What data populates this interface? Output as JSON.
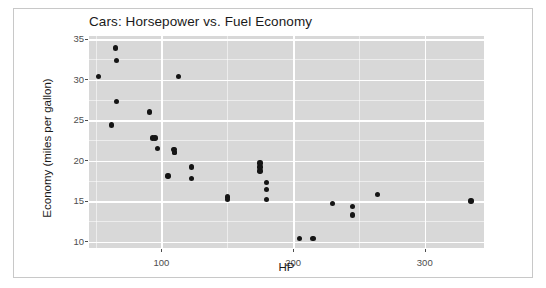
{
  "chart_data": {
    "type": "scatter",
    "title": "Cars: Horsepower vs. Fuel Economy",
    "xlabel": "HP",
    "ylabel": "Economy (miles per gallon)",
    "xlim": [
      45,
      345
    ],
    "ylim": [
      9.2,
      35.4
    ],
    "grid": true,
    "legend": null,
    "x_ticks": [
      100,
      200,
      300
    ],
    "x_tick_labels": [
      "100",
      "200",
      "300"
    ],
    "x_minor_ticks": [
      50,
      150,
      250,
      350
    ],
    "y_ticks": [
      10,
      15,
      20,
      25,
      30,
      35
    ],
    "y_tick_labels": [
      "10",
      "15",
      "20",
      "25",
      "30",
      "35"
    ],
    "y_minor_ticks": [
      12.5,
      17.5,
      22.5,
      27.5,
      32.5
    ],
    "point_color": "#151515",
    "panel_background": "#d8d8d8",
    "gridline_color": "#ffffff",
    "series": [
      {
        "name": "cars",
        "x": [
          110,
          110,
          93,
          110,
          175,
          105,
          245,
          62,
          95,
          123,
          123,
          180,
          180,
          180,
          205,
          215,
          230,
          66,
          52,
          65,
          97,
          150,
          150,
          245,
          175,
          66,
          91,
          113,
          264,
          175,
          335,
          109
        ],
        "y": [
          21.0,
          21.0,
          22.8,
          21.4,
          18.7,
          18.1,
          14.3,
          24.4,
          22.8,
          19.2,
          17.8,
          16.4,
          17.3,
          15.2,
          10.4,
          10.4,
          14.7,
          32.4,
          30.4,
          33.9,
          21.5,
          15.5,
          15.2,
          13.3,
          19.2,
          27.3,
          26.0,
          30.4,
          15.8,
          19.7,
          15.0,
          21.4
        ]
      }
    ]
  },
  "figure": {
    "border_color": "#c8c8c8",
    "background": "#ffffff"
  }
}
